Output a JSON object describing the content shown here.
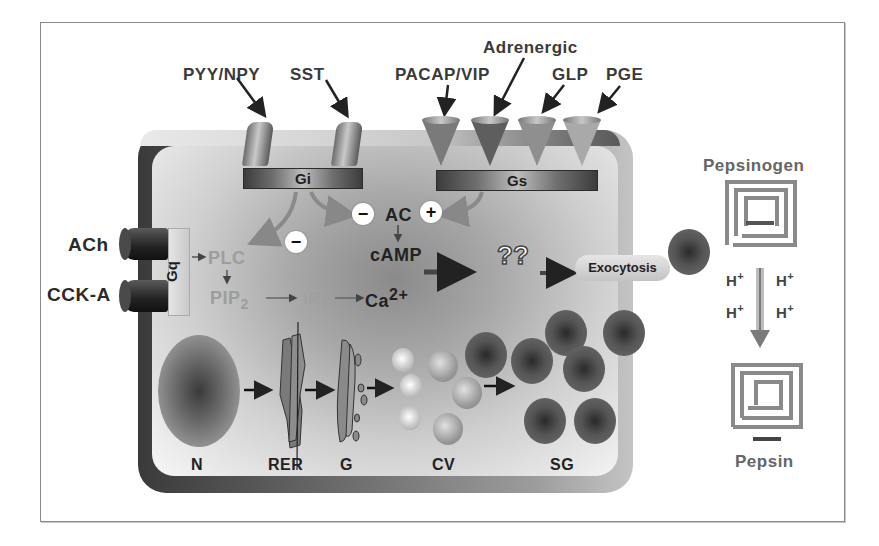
{
  "diagram": {
    "receptors_top": {
      "gi_ligands": [
        "PYY/NPY",
        "SST"
      ],
      "gs_ligands": [
        "PACAP/VIP",
        "Adrenergic",
        "GLP",
        "PGE"
      ]
    },
    "receptors_left": [
      "ACh",
      "CCK-A"
    ],
    "g_proteins": {
      "gi": "Gi",
      "gs": "Gs",
      "gq": "Gq"
    },
    "signaling": {
      "ac": "AC",
      "camp": "cAMP",
      "plc": "PLC",
      "pip2": "PIP",
      "pip2_sub": "2",
      "ip3": "IP",
      "ip3_sub": "3",
      "ca": "Ca",
      "ca_sup": "2+",
      "unknown": "??",
      "exocytosis": "Exocytosis",
      "minus_sign": "−",
      "plus_sign": "+"
    },
    "organelles": {
      "nucleus": "N",
      "rer": "RER",
      "golgi": "G",
      "condensing_vacuoles": "CV",
      "secretory_granules": "SG"
    },
    "activation": {
      "pepsinogen": "Pepsinogen",
      "proton": "H",
      "proton_charge": "+",
      "pepsin": "Pepsin"
    }
  }
}
